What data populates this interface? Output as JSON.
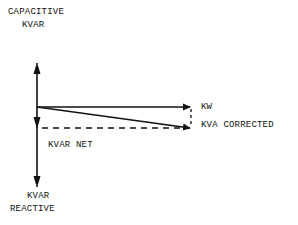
{
  "diagram": {
    "labels": {
      "capacitive_line1": "CAPACITIVE",
      "capacitive_line2": "KVAR",
      "kw": "KW",
      "kva_corrected": "KVA CORRECTED",
      "kvar_net": "KVAR NET",
      "reactive_line1": "KVAR",
      "reactive_line2": "REACTIVE"
    },
    "vectors": [
      {
        "name": "capacitive-kvar",
        "direction": "up",
        "style": "solid"
      },
      {
        "name": "reactive-kvar",
        "direction": "down",
        "style": "solid"
      },
      {
        "name": "kw",
        "direction": "right",
        "style": "solid"
      },
      {
        "name": "kva-corrected",
        "direction": "right-down",
        "style": "solid"
      },
      {
        "name": "kvar-net",
        "direction": "horizontal",
        "style": "dashed"
      },
      {
        "name": "kvar-net-vertical",
        "direction": "vertical",
        "style": "dashed"
      }
    ],
    "colors": {
      "ink": "#111111",
      "background": "#ffffff"
    }
  }
}
